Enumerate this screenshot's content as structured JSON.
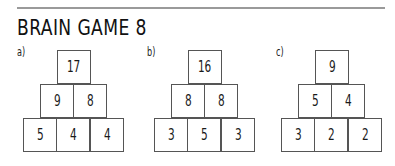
{
  "title": "BRAIN GAME 8",
  "puzzles": [
    {
      "label": "a)",
      "rows": [
        [
          "17"
        ],
        [
          "9",
          "8"
        ],
        [
          "5",
          "4",
          "4"
        ]
      ]
    },
    {
      "label": "b)",
      "rows": [
        [
          "16"
        ],
        [
          "8",
          "8"
        ],
        [
          "3",
          "5",
          "3"
        ]
      ]
    },
    {
      "label": "c)",
      "rows": [
        [
          "9"
        ],
        [
          "5",
          "4"
        ],
        [
          "3",
          "2",
          "2"
        ]
      ]
    }
  ]
}
